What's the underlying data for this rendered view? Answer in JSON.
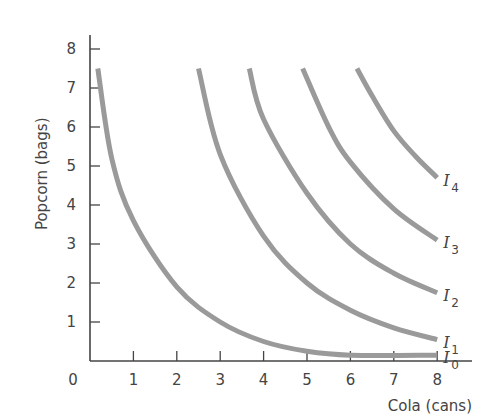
{
  "chart_data": {
    "type": "line",
    "title": "",
    "xlabel": "Cola (cans)",
    "ylabel": "Popcorn (bags)",
    "xlim": [
      0,
      8
    ],
    "ylim": [
      0,
      8
    ],
    "x_ticks": [
      1,
      2,
      3,
      4,
      5,
      6,
      7,
      8
    ],
    "y_ticks": [
      1,
      2,
      3,
      4,
      5,
      6,
      7,
      8
    ],
    "origin_label": "0",
    "grid": false,
    "legend": "inline labels at right end of curves",
    "curve_color": "#9a9a9a",
    "axis_color": "#444444",
    "series": [
      {
        "name": "I0",
        "label": "I",
        "sub": "0",
        "points": [
          [
            0.18,
            7.5
          ],
          [
            0.5,
            5.2
          ],
          [
            1,
            3.6
          ],
          [
            2,
            1.9
          ],
          [
            3,
            1.0
          ],
          [
            4,
            0.5
          ],
          [
            5,
            0.25
          ],
          [
            6,
            0.15
          ],
          [
            8,
            0.15
          ]
        ]
      },
      {
        "name": "I1",
        "label": "I",
        "sub": "1",
        "points": [
          [
            2.5,
            7.5
          ],
          [
            3,
            5.3
          ],
          [
            4,
            3.2
          ],
          [
            5,
            2.0
          ],
          [
            6,
            1.3
          ],
          [
            7,
            0.85
          ],
          [
            8,
            0.55
          ]
        ]
      },
      {
        "name": "I2",
        "label": "I",
        "sub": "2",
        "points": [
          [
            3.67,
            7.5
          ],
          [
            4,
            6.2
          ],
          [
            5,
            4.3
          ],
          [
            6,
            3.0
          ],
          [
            7,
            2.25
          ],
          [
            8,
            1.75
          ]
        ]
      },
      {
        "name": "I3",
        "label": "I",
        "sub": "3",
        "points": [
          [
            4.9,
            7.5
          ],
          [
            5.5,
            6.0
          ],
          [
            6,
            5.1
          ],
          [
            7,
            3.9
          ],
          [
            8,
            3.1
          ]
        ]
      },
      {
        "name": "I4",
        "label": "I",
        "sub": "4",
        "points": [
          [
            6.15,
            7.5
          ],
          [
            6.5,
            6.8
          ],
          [
            7,
            5.9
          ],
          [
            7.5,
            5.25
          ],
          [
            8,
            4.7
          ]
        ]
      }
    ]
  }
}
